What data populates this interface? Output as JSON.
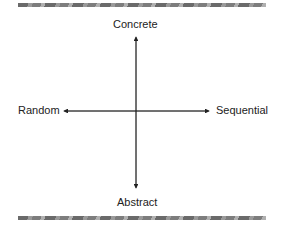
{
  "diagram": {
    "type": "quadrant-axes",
    "labels": {
      "top": "Concrete",
      "bottom": "Abstract",
      "left": "Random",
      "right": "Sequential"
    },
    "colors": {
      "line": "#222222",
      "bar": "#7a7a7a"
    }
  }
}
